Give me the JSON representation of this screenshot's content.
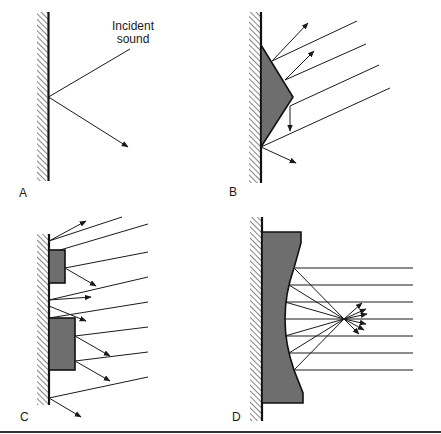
{
  "figure": {
    "panels": [
      {
        "id": "A",
        "label": "A",
        "description": "Specular reflection from a flat wall",
        "annotation_line1": "Incident",
        "annotation_line2": "sound"
      },
      {
        "id": "B",
        "label": "B",
        "description": "Triangular (polycylindrical) diffuser scattering incident rays"
      },
      {
        "id": "C",
        "label": "C",
        "description": "Rectangular projections on wall scattering incident rays"
      },
      {
        "id": "D",
        "label": "D",
        "description": "Concave surface focusing incident sound to a point"
      }
    ],
    "colors": {
      "ink": "#1a1a1a",
      "block_fill": "#6e6e6e",
      "background": "#ffffff"
    }
  }
}
